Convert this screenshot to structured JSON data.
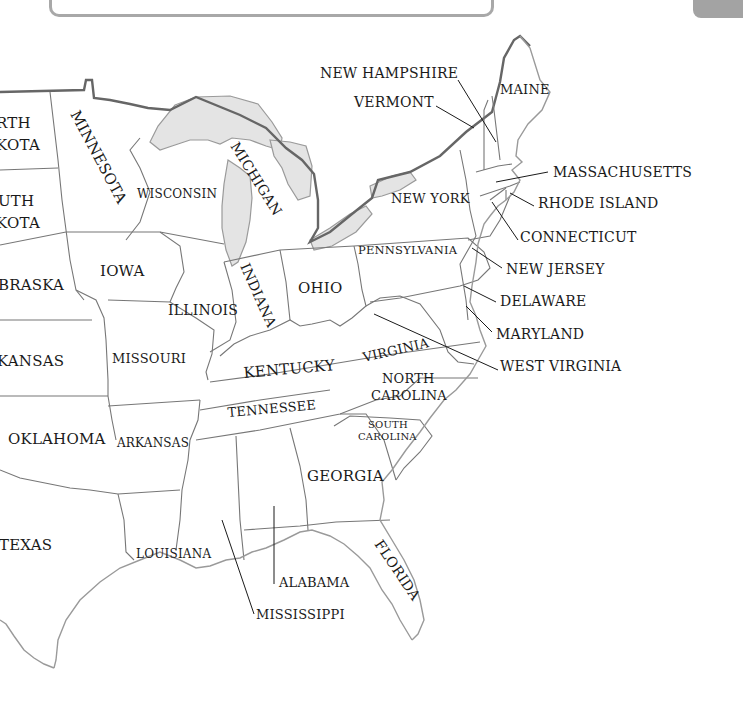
{
  "map": {
    "title": "Eastern United States",
    "style": {
      "ink": "#1a1a1a",
      "border": "#777777",
      "coast": "#9a9a9a",
      "lake_fill": "#e4e4e4",
      "panel_border": "#a8a8a8",
      "tab": "#a3a3a3"
    },
    "states": [
      {
        "id": "north-dakota",
        "label": "NORTH DAKOTA",
        "visible_text": [
          "RTH",
          "KOTA"
        ]
      },
      {
        "id": "south-dakota",
        "label": "SOUTH DAKOTA",
        "visible_text": [
          "UTH",
          "KOTA"
        ]
      },
      {
        "id": "nebraska",
        "label": "NEBRASKA",
        "visible_text": [
          "BRASKA"
        ]
      },
      {
        "id": "kansas",
        "label": "KANSAS",
        "visible_text": [
          "KANSAS"
        ]
      },
      {
        "id": "oklahoma",
        "label": "OKLAHOMA",
        "visible_text": [
          "OKLAHOMA"
        ]
      },
      {
        "id": "texas",
        "label": "TEXAS",
        "visible_text": [
          "TEXAS"
        ]
      },
      {
        "id": "minnesota",
        "label": "MINNESOTA",
        "visible_text": [
          "MINNESOTA"
        ]
      },
      {
        "id": "iowa",
        "label": "IOWA",
        "visible_text": [
          "IOWA"
        ]
      },
      {
        "id": "missouri",
        "label": "MISSOURI",
        "visible_text": [
          "MISSOURI"
        ]
      },
      {
        "id": "arkansas",
        "label": "ARKANSAS",
        "visible_text": [
          "ARKANSAS"
        ]
      },
      {
        "id": "louisiana",
        "label": "LOUISIANA",
        "visible_text": [
          "LOUISIANA"
        ]
      },
      {
        "id": "wisconsin",
        "label": "WISCONSIN",
        "visible_text": [
          "WISCONSIN"
        ]
      },
      {
        "id": "illinois",
        "label": "ILLINOIS",
        "visible_text": [
          "ILLINOIS"
        ]
      },
      {
        "id": "michigan",
        "label": "MICHIGAN",
        "visible_text": [
          "MICHIGAN"
        ]
      },
      {
        "id": "indiana",
        "label": "INDIANA",
        "visible_text": [
          "INDIANA"
        ]
      },
      {
        "id": "ohio",
        "label": "OHIO",
        "visible_text": [
          "OHIO"
        ]
      },
      {
        "id": "kentucky",
        "label": "KENTUCKY",
        "visible_text": [
          "KENTUCKY"
        ]
      },
      {
        "id": "tennessee",
        "label": "TENNESSEE",
        "visible_text": [
          "TENNESSEE"
        ]
      },
      {
        "id": "mississippi",
        "label": "MISSISSIPPI",
        "visible_text": [
          "MISSISSIPPI"
        ]
      },
      {
        "id": "alabama",
        "label": "ALABAMA",
        "visible_text": [
          "ALABAMA"
        ]
      },
      {
        "id": "georgia",
        "label": "GEORGIA",
        "visible_text": [
          "GEORGIA"
        ]
      },
      {
        "id": "florida",
        "label": "FLORIDA",
        "visible_text": [
          "FLORIDA"
        ]
      },
      {
        "id": "south-carolina",
        "label": "SOUTH CAROLINA",
        "visible_text": [
          "SOUTH",
          "CAROLINA"
        ]
      },
      {
        "id": "north-carolina",
        "label": "NORTH CAROLINA",
        "visible_text": [
          "NORTH",
          "CAROLINA"
        ]
      },
      {
        "id": "virginia",
        "label": "VIRGINIA",
        "visible_text": [
          "VIRGINIA"
        ]
      },
      {
        "id": "west-virginia",
        "label": "WEST VIRGINIA",
        "visible_text": [
          "WEST VIRGINIA"
        ]
      },
      {
        "id": "maryland",
        "label": "MARYLAND",
        "visible_text": [
          "MARYLAND"
        ]
      },
      {
        "id": "delaware",
        "label": "DELAWARE",
        "visible_text": [
          "DELAWARE"
        ]
      },
      {
        "id": "new-jersey",
        "label": "NEW JERSEY",
        "visible_text": [
          "NEW JERSEY"
        ]
      },
      {
        "id": "pennsylvania",
        "label": "PENNSYLVANIA",
        "visible_text": [
          "PENNSYLVANIA"
        ]
      },
      {
        "id": "new-york",
        "label": "NEW YORK",
        "visible_text": [
          "NEW YORK"
        ]
      },
      {
        "id": "connecticut",
        "label": "CONNECTICUT",
        "visible_text": [
          "CONNECTICUT"
        ]
      },
      {
        "id": "rhode-island",
        "label": "RHODE ISLAND",
        "visible_text": [
          "RHODE ISLAND"
        ]
      },
      {
        "id": "massachusetts",
        "label": "MASSACHUSETTS",
        "visible_text": [
          "MASSACHUSETTS"
        ]
      },
      {
        "id": "vermont",
        "label": "VERMONT",
        "visible_text": [
          "VERMONT"
        ]
      },
      {
        "id": "new-hampshire",
        "label": "NEW HAMPSHIRE",
        "visible_text": [
          "NEW HAMPSHIRE"
        ]
      },
      {
        "id": "maine",
        "label": "MAINE",
        "visible_text": [
          "MAINE"
        ]
      }
    ]
  }
}
